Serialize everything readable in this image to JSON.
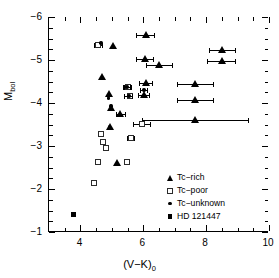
{
  "chart_data": {
    "type": "scatter",
    "title": "",
    "xlabel": "(V−K)₀",
    "ylabel": "M_bol",
    "xlim": [
      3,
      10
    ],
    "ylim": [
      -1,
      -6
    ],
    "y_inverted": true,
    "grid": false,
    "xticks": [
      4,
      6,
      8,
      10
    ],
    "xtick_labels": [
      "4",
      "6",
      "8",
      "10"
    ],
    "xticks_minor": [
      3.5,
      4.5,
      5.0,
      5.5,
      6.5,
      7.0,
      7.5,
      8.5,
      9.0,
      9.5
    ],
    "yticks": [
      -6,
      -5,
      -4,
      -3,
      -2,
      -1
    ],
    "ytick_labels": [
      "−6",
      "−5",
      "−4",
      "−3",
      "−2",
      "−1"
    ],
    "yticks_minor": [
      -5.75,
      -5.5,
      -5.25,
      -4.75,
      -4.5,
      -4.25,
      -3.75,
      -3.5,
      -3.25,
      -2.75,
      -2.5,
      -2.25,
      -1.75,
      -1.5,
      -1.25
    ],
    "legend_position": "lower right",
    "series": [
      {
        "name": "Tc−rich",
        "marker": "filled-triangle",
        "color": "#000000",
        "points": [
          {
            "x": 5.05,
            "y": -5.33,
            "xerr": 0.0
          },
          {
            "x": 6.08,
            "y": -5.59,
            "xerr": 0.3
          },
          {
            "x": 8.52,
            "y": -5.23,
            "xerr": 0.42
          },
          {
            "x": 6.05,
            "y": -5.02,
            "xerr": 0.28
          },
          {
            "x": 8.5,
            "y": -4.97,
            "xerr": 0.46
          },
          {
            "x": 6.52,
            "y": -4.88,
            "xerr": 0.42
          },
          {
            "x": 4.68,
            "y": -4.61,
            "xerr": 0.0
          },
          {
            "x": 6.08,
            "y": -4.46,
            "xerr": 0.22
          },
          {
            "x": 7.66,
            "y": -4.45,
            "xerr": 0.6
          },
          {
            "x": 4.93,
            "y": -4.22,
            "xerr": 0.0
          },
          {
            "x": 6.02,
            "y": -4.18,
            "xerr": 0.18
          },
          {
            "x": 7.66,
            "y": -4.07,
            "xerr": 0.6
          },
          {
            "x": 4.97,
            "y": -3.88,
            "xerr": 0.0
          },
          {
            "x": 5.28,
            "y": -3.75,
            "xerr": 0.16
          },
          {
            "x": 7.66,
            "y": -3.61,
            "xerr": 1.7
          },
          {
            "x": 4.94,
            "y": -3.44,
            "xerr": 0.0
          },
          {
            "x": 5.18,
            "y": -2.62,
            "xerr": 0.0
          }
        ]
      },
      {
        "name": "Tc−poor",
        "marker": "open-square",
        "color": "#2b2b2b",
        "points": [
          {
            "x": 4.58,
            "y": -5.34,
            "xerr": 0.14
          },
          {
            "x": 5.52,
            "y": -4.37,
            "xerr": 0.12
          },
          {
            "x": 5.58,
            "y": -4.16,
            "xerr": 0.0
          },
          {
            "x": 5.96,
            "y": -3.51,
            "xerr": 0.3
          },
          {
            "x": 4.68,
            "y": -3.27,
            "xerr": 0.0
          },
          {
            "x": 5.62,
            "y": -3.18,
            "xerr": 0.13
          },
          {
            "x": 4.72,
            "y": -3.08,
            "xerr": 0.0
          },
          {
            "x": 4.82,
            "y": -2.95,
            "xerr": 0.0
          },
          {
            "x": 4.56,
            "y": -2.62,
            "xerr": 0.0
          },
          {
            "x": 5.5,
            "y": -2.62,
            "xerr": 0.0
          },
          {
            "x": 4.44,
            "y": -2.12,
            "xerr": 0.0
          }
        ]
      },
      {
        "name": "Tc−unknown",
        "marker": "small-dot",
        "color": "#000000",
        "points": [
          {
            "x": 4.66,
            "y": -5.4,
            "xerr": 0.0
          },
          {
            "x": 5.48,
            "y": -4.37,
            "xerr": 0.13
          },
          {
            "x": 6.02,
            "y": -4.3,
            "xerr": 0.13
          },
          {
            "x": 4.9,
            "y": -4.12,
            "xerr": 0.0
          },
          {
            "x": 5.54,
            "y": -4.16,
            "xerr": 0.14
          },
          {
            "x": 4.97,
            "y": -3.93,
            "xerr": 0.0
          },
          {
            "x": 4.92,
            "y": -3.45,
            "xerr": 0.0
          }
        ]
      },
      {
        "name": "HD 121447",
        "marker": "filled-square",
        "color": "#000000",
        "points": [
          {
            "x": 3.78,
            "y": -1.4,
            "xerr": 0.0
          }
        ]
      }
    ],
    "legend_entries": [
      {
        "label": "Tc−rich",
        "marker": "filled-triangle"
      },
      {
        "label": "Tc−poor",
        "marker": "open-square"
      },
      {
        "label": "Tc−unknown",
        "marker": "small-dot"
      },
      {
        "label": "HD 121447",
        "marker": "filled-square"
      }
    ]
  }
}
